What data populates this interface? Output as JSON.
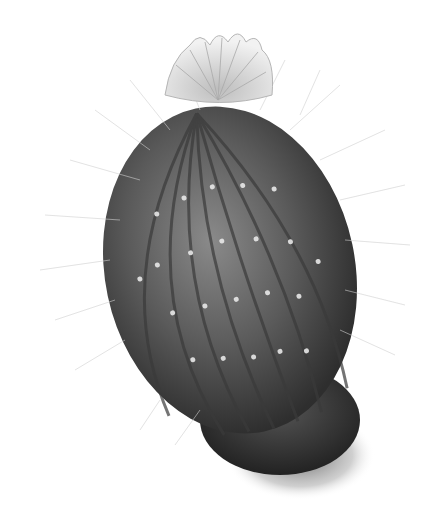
{
  "image": {
    "subject": "cactus",
    "style": "grayscale illustration",
    "background_color": "#ffffff",
    "colors": {
      "body_dark": "#2e2e2e",
      "body_mid": "#6a6a6a",
      "spine": "#d9d9d9",
      "flower": "#e6e6e6",
      "shadow": "#555555"
    }
  }
}
